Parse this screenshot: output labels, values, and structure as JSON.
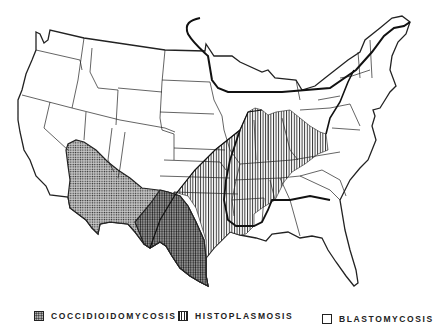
{
  "map": {
    "subject": "Endemic regions of systemic mycoses in the contiguous United States",
    "regions": [
      {
        "id": "coccidioidomycosis",
        "pattern": "stippled/dotted",
        "area": "Southwest: southern California, Arizona, New Mexico, western Texas"
      },
      {
        "id": "histoplasmosis",
        "pattern": "vertical hatching",
        "area": "Central: Mississippi and Ohio River valleys"
      },
      {
        "id": "blastomycosis",
        "pattern": "outline only",
        "area": "Great Lakes, St. Lawrence, southeastern states"
      }
    ],
    "colors": {
      "ink": "#222222",
      "background": "#ffffff",
      "stipple_fill": "#bbbbbb"
    }
  },
  "legend": {
    "items": [
      {
        "label": "COCCIDIOIDOMYCOSIS",
        "swatch": "dotted"
      },
      {
        "label": "HISTOPLASMOSIS",
        "swatch": "vertical-lines"
      },
      {
        "label": "BLASTOMYCOSIS",
        "swatch": "empty"
      }
    ]
  }
}
